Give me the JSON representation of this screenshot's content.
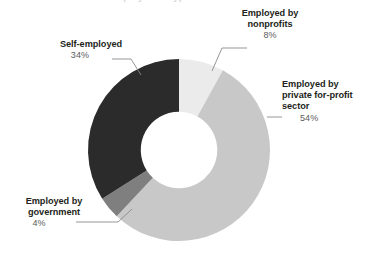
{
  "title_fragment": "Employment type",
  "colors": {
    "nonprofits": "#ebebeb",
    "private": "#c8c8c8",
    "government": "#7f7f7f",
    "self_employed": "#2b2b2b",
    "background": "#ffffff",
    "label_text": "#231f20",
    "percent_text": "#5b5b5b",
    "leader_line": "#8a8a8a"
  },
  "labels": {
    "nonprofits": {
      "name": "Employed by nonprofits",
      "percent": "8%"
    },
    "private": {
      "name": "Employed by private for-profit sector",
      "percent": "54%"
    },
    "government": {
      "name": "Employed by government",
      "percent": "4%"
    },
    "self_employed": {
      "name": "Self-employed",
      "percent": "34%"
    }
  },
  "chart_data": {
    "type": "pie",
    "variant": "donut",
    "title": "Employment type",
    "categories": [
      "Employed by nonprofits",
      "Employed by private for-profit sector",
      "Employed by government",
      "Self-employed"
    ],
    "values": [
      8,
      54,
      4,
      34
    ],
    "value_labels": [
      "8%",
      "54%",
      "4%",
      "34%"
    ],
    "unit": "percent",
    "total": 100,
    "colors": [
      "#ebebeb",
      "#c8c8c8",
      "#7f7f7f",
      "#2b2b2b"
    ],
    "start_angle_deg": 0,
    "direction": "clockwise",
    "inner_radius_ratio": 0.42,
    "legend": "none",
    "labels_position": "outside-with-leader-lines",
    "grid": false,
    "xlabel": "",
    "ylabel": ""
  }
}
